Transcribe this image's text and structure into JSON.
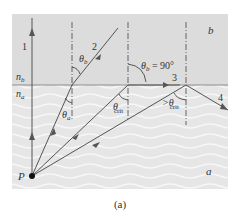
{
  "figure": {
    "caption": "(a)",
    "medium_top_label": "b",
    "medium_bottom_label": "a",
    "n_top_label": "n",
    "n_top_sub": "b",
    "n_bottom_label": "n",
    "n_bottom_sub": "a",
    "source_label": "P",
    "rays": [
      {
        "id": "1",
        "label": "1"
      },
      {
        "id": "2",
        "label": "2"
      },
      {
        "id": "3",
        "label": "3"
      },
      {
        "id": "4",
        "label": "4"
      }
    ],
    "angles": {
      "theta_b": "θ",
      "theta_b_sub": "b",
      "theta_a": "θ",
      "theta_a_sub": "a",
      "theta_b_90": "θ",
      "theta_b_90_sub": "b",
      "theta_b_90_value": " = 90°",
      "theta_crit": "θ",
      "theta_crit_sub": "crit",
      "gt_theta_crit": ">θ",
      "gt_theta_crit_sub": "crit"
    },
    "colors": {
      "top_medium": "#dcdcdc",
      "bottom_medium": "#e9e9e9",
      "ray": "#555555",
      "interface": "#777777"
    }
  }
}
